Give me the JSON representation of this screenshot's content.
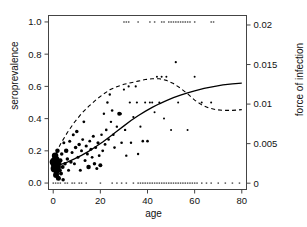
{
  "chart_data": {
    "type": "scatter",
    "title": "",
    "xlabel": "age",
    "ylabel": "seroprevalence",
    "ylabel_right": "force of infection",
    "xlim": [
      -2,
      82
    ],
    "ylim": [
      -0.04,
      1.04
    ],
    "ylim_right": [
      -0.0008,
      0.0212
    ],
    "grid": false,
    "legend": "none",
    "xticks": [
      0,
      20,
      40,
      60,
      80
    ],
    "xtick_labels": [
      "0",
      "20",
      "40",
      "60",
      "80"
    ],
    "yticks": [
      0.0,
      0.2,
      0.4,
      0.6,
      0.8,
      1.0
    ],
    "ytick_labels": [
      "0.0",
      "0.2",
      "0.4",
      "0.6",
      "0.8",
      "1.0"
    ],
    "yticks_right": [
      0,
      0.005,
      0.01,
      0.015,
      0.02
    ],
    "ytick_labels_right": [
      "0",
      "0.005",
      "0.01",
      "0.015",
      "0.02"
    ],
    "series": [
      {
        "name": "observed seroprevalence",
        "type": "scatter",
        "marker": "filled-circle",
        "color": "#000000",
        "note": "marker area proportional to sample size",
        "points": [
          {
            "x": 0.5,
            "y": 0.13,
            "size": 9.5
          },
          {
            "x": 0.6,
            "y": 0.09,
            "size": 8.0
          },
          {
            "x": 0.8,
            "y": 0.17,
            "size": 6.5
          },
          {
            "x": 1.0,
            "y": 0.11,
            "size": 7.5
          },
          {
            "x": 1.2,
            "y": 0.05,
            "size": 6.0
          },
          {
            "x": 1.4,
            "y": 0.07,
            "size": 5.5
          },
          {
            "x": 1.6,
            "y": 0.15,
            "size": 5.0
          },
          {
            "x": 1.8,
            "y": 0.2,
            "size": 4.5
          },
          {
            "x": 2.0,
            "y": 0.1,
            "size": 6.0
          },
          {
            "x": 2.2,
            "y": 0.03,
            "size": 5.0
          },
          {
            "x": 2.5,
            "y": 0.12,
            "size": 4.5
          },
          {
            "x": 2.8,
            "y": 0.08,
            "size": 4.0
          },
          {
            "x": 3.0,
            "y": 0.14,
            "size": 4.5
          },
          {
            "x": 3.3,
            "y": 0.06,
            "size": 4.0
          },
          {
            "x": 3.6,
            "y": 0.18,
            "size": 3.5
          },
          {
            "x": 4.0,
            "y": 0.1,
            "size": 4.0
          },
          {
            "x": 4.2,
            "y": 0.02,
            "size": 3.5
          },
          {
            "x": 4.5,
            "y": 0.25,
            "size": 3.0
          },
          {
            "x": 5.0,
            "y": 0.12,
            "size": 3.5
          },
          {
            "x": 5.5,
            "y": 0.2,
            "size": 4.5
          },
          {
            "x": 6.0,
            "y": 0.15,
            "size": 3.5
          },
          {
            "x": 6.5,
            "y": 0.08,
            "size": 3.0
          },
          {
            "x": 7.0,
            "y": 0.26,
            "size": 3.0
          },
          {
            "x": 7.5,
            "y": 0.13,
            "size": 3.5
          },
          {
            "x": 8.0,
            "y": 0.19,
            "size": 3.0
          },
          {
            "x": 8.5,
            "y": 0.3,
            "size": 3.0
          },
          {
            "x": 9.0,
            "y": 0.12,
            "size": 3.0
          },
          {
            "x": 9.5,
            "y": 0.22,
            "size": 3.5
          },
          {
            "x": 10.0,
            "y": 0.32,
            "size": 3.5
          },
          {
            "x": 10.5,
            "y": 0.16,
            "size": 3.0
          },
          {
            "x": 11.0,
            "y": 0.24,
            "size": 3.5
          },
          {
            "x": 11.5,
            "y": 0.08,
            "size": 3.0
          },
          {
            "x": 12.0,
            "y": 0.2,
            "size": 3.0
          },
          {
            "x": 12.5,
            "y": 0.27,
            "size": 2.8
          },
          {
            "x": 13.0,
            "y": 0.38,
            "size": 2.8
          },
          {
            "x": 13.5,
            "y": 0.14,
            "size": 3.0
          },
          {
            "x": 14.0,
            "y": 0.23,
            "size": 3.2
          },
          {
            "x": 14.5,
            "y": 0.18,
            "size": 3.0
          },
          {
            "x": 15.0,
            "y": 0.1,
            "size": 4.5
          },
          {
            "x": 15.5,
            "y": 0.26,
            "size": 2.8
          },
          {
            "x": 16.0,
            "y": 0.21,
            "size": 3.0
          },
          {
            "x": 16.5,
            "y": 0.16,
            "size": 2.8
          },
          {
            "x": 17.0,
            "y": 0.29,
            "size": 3.0
          },
          {
            "x": 17.5,
            "y": 0.12,
            "size": 3.5
          },
          {
            "x": 18.0,
            "y": 0.22,
            "size": 3.0
          },
          {
            "x": 18.5,
            "y": 0.09,
            "size": 3.0
          },
          {
            "x": 19.0,
            "y": 0.25,
            "size": 3.2
          },
          {
            "x": 19.5,
            "y": 0.17,
            "size": 2.8
          },
          {
            "x": 20.0,
            "y": 0.11,
            "size": 4.0
          },
          {
            "x": 20.5,
            "y": 0.3,
            "size": 2.6
          },
          {
            "x": 21.0,
            "y": 0.2,
            "size": 2.8
          },
          {
            "x": 21.5,
            "y": 0.43,
            "size": 2.4
          },
          {
            "x": 22.0,
            "y": 0.24,
            "size": 2.8
          },
          {
            "x": 22.5,
            "y": 0.33,
            "size": 2.6
          },
          {
            "x": 23.0,
            "y": 0.5,
            "size": 2.4
          },
          {
            "x": 23.5,
            "y": 0.27,
            "size": 2.6
          },
          {
            "x": 24.0,
            "y": 0.55,
            "size": 2.4
          },
          {
            "x": 24.5,
            "y": 0.38,
            "size": 2.4
          },
          {
            "x": 25.0,
            "y": 0.45,
            "size": 2.6
          },
          {
            "x": 25.5,
            "y": 0.3,
            "size": 2.6
          },
          {
            "x": 26.0,
            "y": 0.22,
            "size": 2.6
          },
          {
            "x": 27.0,
            "y": 0.35,
            "size": 2.4
          },
          {
            "x": 28.0,
            "y": 0.43,
            "size": 4.0
          },
          {
            "x": 28.5,
            "y": 0.43,
            "size": 3.0
          },
          {
            "x": 29.0,
            "y": 0.25,
            "size": 2.6
          },
          {
            "x": 30.0,
            "y": 0.58,
            "size": 2.2
          },
          {
            "x": 30.5,
            "y": 0.33,
            "size": 2.4
          },
          {
            "x": 31.0,
            "y": 0.17,
            "size": 2.4
          },
          {
            "x": 32.0,
            "y": 0.6,
            "size": 2.2
          },
          {
            "x": 32.5,
            "y": 0.5,
            "size": 2.2
          },
          {
            "x": 33.0,
            "y": 0.25,
            "size": 2.4
          },
          {
            "x": 34.0,
            "y": 0.41,
            "size": 2.2
          },
          {
            "x": 35.0,
            "y": 0.6,
            "size": 2.2
          },
          {
            "x": 35.5,
            "y": 0.5,
            "size": 2.2
          },
          {
            "x": 36.0,
            "y": 0.18,
            "size": 2.4
          },
          {
            "x": 37.0,
            "y": 0.35,
            "size": 2.2
          },
          {
            "x": 38.0,
            "y": 0.26,
            "size": 2.6
          },
          {
            "x": 39.0,
            "y": 0.5,
            "size": 2.0
          },
          {
            "x": 40.0,
            "y": 0.26,
            "size": 2.6
          },
          {
            "x": 41.0,
            "y": 0.5,
            "size": 2.0
          },
          {
            "x": 42.0,
            "y": 0.5,
            "size": 2.0
          },
          {
            "x": 43.0,
            "y": 0.44,
            "size": 2.0
          },
          {
            "x": 44.0,
            "y": 0.66,
            "size": 2.0
          },
          {
            "x": 45.0,
            "y": 0.5,
            "size": 2.0
          },
          {
            "x": 46.0,
            "y": 0.66,
            "size": 2.0
          },
          {
            "x": 47.0,
            "y": 0.4,
            "size": 2.0
          },
          {
            "x": 48.0,
            "y": 0.66,
            "size": 2.0
          },
          {
            "x": 50.0,
            "y": 0.33,
            "size": 2.0
          },
          {
            "x": 52.0,
            "y": 0.75,
            "size": 2.2
          },
          {
            "x": 53.0,
            "y": 0.5,
            "size": 2.0
          },
          {
            "x": 57.0,
            "y": 0.33,
            "size": 2.0
          },
          {
            "x": 60.0,
            "y": 0.66,
            "size": 2.0
          },
          {
            "x": 63.0,
            "y": 0.5,
            "size": 2.0
          },
          {
            "x": 67.0,
            "y": 0.5,
            "size": 2.0
          }
        ]
      },
      {
        "name": "seropositive individuals (y = 1)",
        "type": "rug-top",
        "marker": "small-dot",
        "color": "#555555",
        "y": 1.0,
        "x_values": [
          30,
          31,
          32,
          36,
          41,
          43,
          46,
          47,
          49,
          50,
          51,
          52,
          53,
          54,
          55,
          56,
          57,
          58,
          60,
          67,
          68
        ]
      },
      {
        "name": "seronegative individuals (y = 0)",
        "type": "rug-bottom",
        "marker": "small-dot",
        "color": "#555555",
        "y": 0.0,
        "x_values": [
          0,
          1,
          2,
          3,
          5,
          6,
          8,
          9,
          11,
          12,
          14,
          20,
          25,
          27,
          29,
          31,
          34,
          36,
          37,
          38,
          39,
          40,
          41,
          42,
          43,
          44,
          45,
          46,
          47,
          48,
          49,
          50,
          51,
          52,
          53,
          54,
          55,
          56,
          57,
          58,
          59,
          60,
          61,
          63,
          65,
          67,
          70,
          73,
          76,
          79
        ]
      },
      {
        "name": "fitted seroprevalence",
        "type": "line",
        "style": "solid",
        "color": "#000000",
        "points": [
          {
            "x": 0,
            "y": 0.105
          },
          {
            "x": 3,
            "y": 0.115
          },
          {
            "x": 6,
            "y": 0.13
          },
          {
            "x": 9,
            "y": 0.15
          },
          {
            "x": 12,
            "y": 0.172
          },
          {
            "x": 15,
            "y": 0.197
          },
          {
            "x": 18,
            "y": 0.225
          },
          {
            "x": 21,
            "y": 0.255
          },
          {
            "x": 24,
            "y": 0.288
          },
          {
            "x": 27,
            "y": 0.322
          },
          {
            "x": 30,
            "y": 0.355
          },
          {
            "x": 33,
            "y": 0.388
          },
          {
            "x": 36,
            "y": 0.418
          },
          {
            "x": 39,
            "y": 0.445
          },
          {
            "x": 42,
            "y": 0.47
          },
          {
            "x": 45,
            "y": 0.492
          },
          {
            "x": 48,
            "y": 0.512
          },
          {
            "x": 51,
            "y": 0.53
          },
          {
            "x": 54,
            "y": 0.546
          },
          {
            "x": 57,
            "y": 0.56
          },
          {
            "x": 60,
            "y": 0.572
          },
          {
            "x": 64,
            "y": 0.587
          },
          {
            "x": 68,
            "y": 0.599
          },
          {
            "x": 72,
            "y": 0.609
          },
          {
            "x": 76,
            "y": 0.616
          },
          {
            "x": 80,
            "y": 0.62
          }
        ]
      },
      {
        "name": "force of infection",
        "type": "line",
        "style": "dashed",
        "color": "#000000",
        "axis": "right",
        "points": [
          {
            "x": 0,
            "y": 0.003
          },
          {
            "x": 3,
            "y": 0.0049
          },
          {
            "x": 6,
            "y": 0.0064
          },
          {
            "x": 9,
            "y": 0.0077
          },
          {
            "x": 12,
            "y": 0.0088
          },
          {
            "x": 15,
            "y": 0.0097
          },
          {
            "x": 18,
            "y": 0.0105
          },
          {
            "x": 21,
            "y": 0.0112
          },
          {
            "x": 24,
            "y": 0.0118
          },
          {
            "x": 27,
            "y": 0.0122
          },
          {
            "x": 30,
            "y": 0.0125
          },
          {
            "x": 33,
            "y": 0.0127
          },
          {
            "x": 36,
            "y": 0.0129
          },
          {
            "x": 39,
            "y": 0.0131
          },
          {
            "x": 42,
            "y": 0.0132
          },
          {
            "x": 45,
            "y": 0.0132
          },
          {
            "x": 48,
            "y": 0.013
          },
          {
            "x": 51,
            "y": 0.0126
          },
          {
            "x": 54,
            "y": 0.012
          },
          {
            "x": 57,
            "y": 0.0113
          },
          {
            "x": 60,
            "y": 0.0105
          },
          {
            "x": 63,
            "y": 0.0099
          },
          {
            "x": 66,
            "y": 0.0095
          },
          {
            "x": 69,
            "y": 0.0093
          },
          {
            "x": 72,
            "y": 0.0092
          },
          {
            "x": 76,
            "y": 0.0092
          },
          {
            "x": 80,
            "y": 0.0093
          }
        ]
      }
    ]
  }
}
